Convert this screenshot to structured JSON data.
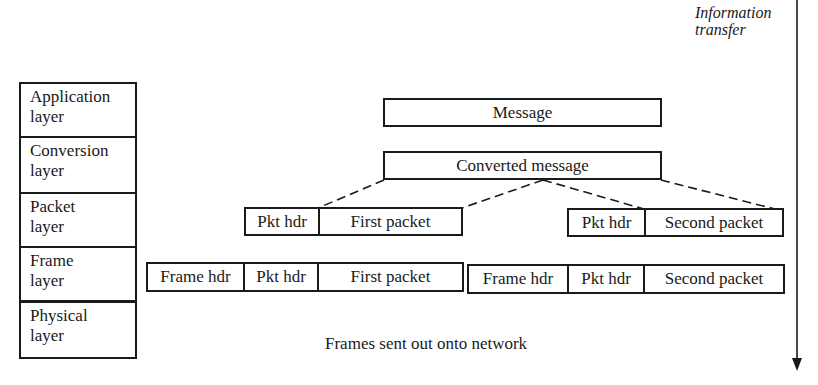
{
  "layers": [
    {
      "line1": "Application",
      "line2": "layer"
    },
    {
      "line1": "Conversion",
      "line2": "layer"
    },
    {
      "line1": "Packet",
      "line2": "layer"
    },
    {
      "line1": "Frame",
      "line2": "layer"
    },
    {
      "line1": "Physical",
      "line2": "layer"
    }
  ],
  "message": "Message",
  "converted_message": "Converted message",
  "packets": [
    {
      "header": "Pkt hdr",
      "body": "First packet"
    },
    {
      "header": "Pkt hdr",
      "body": "Second packet"
    }
  ],
  "frames": [
    {
      "frame_header": "Frame hdr",
      "packet_header": "Pkt hdr",
      "body": "First packet"
    },
    {
      "frame_header": "Frame hdr",
      "packet_header": "Pkt hdr",
      "body": "Second packet"
    }
  ],
  "bottom_caption": "Frames sent out onto network",
  "direction_label": {
    "line1": "Information",
    "line2": "transfer"
  }
}
